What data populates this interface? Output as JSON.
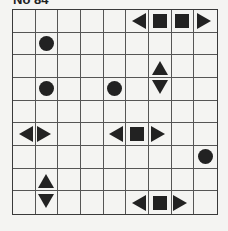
{
  "puzzle": {
    "title": "No 84",
    "rows": 9,
    "cols": 9,
    "piece_color": "#222222",
    "grid_color": "#555555",
    "background": "#f4f4f2",
    "cells": [
      [
        "",
        "",
        "",
        "",
        "",
        "left",
        "square",
        "square",
        "right"
      ],
      [
        "",
        "circle",
        "",
        "",
        "",
        "",
        "",
        "",
        ""
      ],
      [
        "",
        "",
        "",
        "",
        "",
        "",
        "up",
        "",
        ""
      ],
      [
        "",
        "circle",
        "",
        "",
        "circle",
        "",
        "down",
        "",
        ""
      ],
      [
        "",
        "",
        "",
        "",
        "",
        "",
        "",
        "",
        ""
      ],
      [
        "left",
        "right",
        "",
        "",
        "left",
        "square",
        "right",
        "",
        ""
      ],
      [
        "",
        "",
        "",
        "",
        "",
        "",
        "",
        "",
        "circle"
      ],
      [
        "",
        "up",
        "",
        "",
        "",
        "",
        "",
        "",
        ""
      ],
      [
        "",
        "down",
        "",
        "",
        "",
        "left",
        "square",
        "right",
        ""
      ]
    ]
  }
}
